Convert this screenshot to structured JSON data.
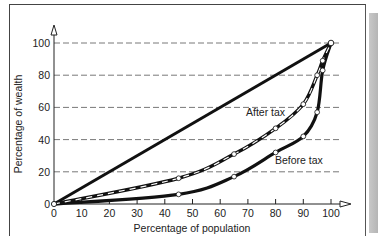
{
  "chart_data": {
    "type": "line",
    "title": "",
    "xlabel": "Percentage of population",
    "ylabel": "Percentage of wealth",
    "xlim": [
      0,
      100
    ],
    "ylim": [
      0,
      100
    ],
    "x_ticks": [
      0,
      10,
      20,
      30,
      40,
      50,
      60,
      70,
      80,
      90,
      100
    ],
    "y_ticks": [
      0,
      20,
      40,
      60,
      80,
      100
    ],
    "grid": "horizontal dashed at 20, 40, 60, 80, 100",
    "legend": "none (inline curve labels)",
    "series": [
      {
        "name": "Line of equality",
        "style": "solid thick",
        "x": [
          0,
          100
        ],
        "y": [
          0,
          100
        ]
      },
      {
        "name": "After tax",
        "style": "dashed black-white with open circle markers",
        "x": [
          0,
          45,
          65,
          80,
          90,
          95,
          97,
          100
        ],
        "y": [
          0,
          16,
          31,
          47,
          62,
          80,
          89,
          100
        ]
      },
      {
        "name": "Before tax",
        "style": "solid thick with open circle markers",
        "x": [
          0,
          45,
          65,
          80,
          90,
          95,
          97,
          100
        ],
        "y": [
          0,
          6,
          17,
          32,
          42,
          57,
          83,
          100
        ]
      }
    ],
    "annotations": [
      "After tax",
      "Before tax"
    ]
  },
  "labels": {
    "xlabel": "Percentage of population",
    "ylabel": "Percentage of wealth",
    "after_tax": "After tax",
    "before_tax": "Before tax",
    "x_ticks": [
      "0",
      "10",
      "20",
      "30",
      "40",
      "50",
      "60",
      "70",
      "80",
      "90",
      "100"
    ],
    "y_ticks": [
      "0",
      "20",
      "40",
      "60",
      "80",
      "100"
    ]
  }
}
